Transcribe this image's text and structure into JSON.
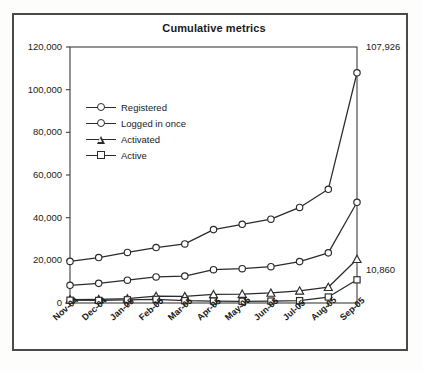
{
  "chart_data": {
    "type": "line",
    "title": "Cumulative metrics",
    "xlabel": "",
    "ylabel": "",
    "ylim": [
      0,
      120000
    ],
    "yticks": [
      0,
      20000,
      40000,
      60000,
      80000,
      100000,
      120000
    ],
    "ytick_labels": [
      "0",
      "20,000",
      "40,000",
      "60,000",
      "80,000",
      "100,000",
      "120,000"
    ],
    "categories": [
      "Nov-04",
      "Dec-04",
      "Jan-05",
      "Feb-05",
      "Mar-05",
      "Apr-05",
      "May-05",
      "Jun-05",
      "Jul-05",
      "Aug-05",
      "Sep-05"
    ],
    "grid": false,
    "legend_position": "upper-left-inside",
    "series": [
      {
        "name": "Registered",
        "marker": "circle",
        "values": [
          19500,
          21300,
          23700,
          26000,
          27700,
          34400,
          36900,
          39300,
          44800,
          53300,
          107926
        ]
      },
      {
        "name": "Logged in once",
        "marker": "circle",
        "values": [
          8300,
          9200,
          10700,
          12200,
          12600,
          15600,
          16100,
          17000,
          19400,
          23500,
          47200
        ]
      },
      {
        "name": "Activated",
        "marker": "triangle",
        "values": [
          1600,
          1700,
          2000,
          3200,
          3100,
          4000,
          4200,
          4700,
          5700,
          7400,
          20500
        ]
      },
      {
        "name": "Active",
        "marker": "square",
        "values": [
          1300,
          1200,
          1500,
          1700,
          1100,
          900,
          800,
          900,
          1100,
          2800,
          10860
        ]
      }
    ],
    "annotations": [
      {
        "text": "107,926",
        "series": "Registered",
        "at": "Sep-05"
      },
      {
        "text": "10,860",
        "series": "Active",
        "at": "Sep-05"
      }
    ]
  }
}
